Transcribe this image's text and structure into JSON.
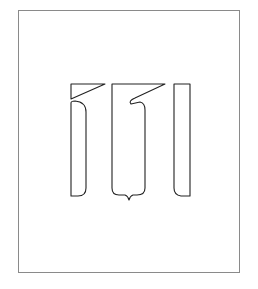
{
  "figure": {
    "glyph_count": 3,
    "stroke_color": "#222222",
    "frame_color": "#8a8a8a",
    "background": "#ffffff"
  },
  "glyphs": [
    {
      "name": "glyph-left",
      "shape": "tall stroke with slanted flag at top"
    },
    {
      "name": "glyph-middle",
      "shape": "wide loop with slanted hook and bottom tail"
    },
    {
      "name": "glyph-right",
      "shape": "tall plain stroke"
    }
  ]
}
